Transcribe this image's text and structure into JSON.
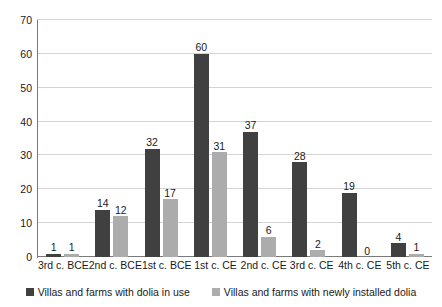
{
  "chart_data": {
    "type": "bar",
    "title": "",
    "subtitle": "",
    "xlabel": "",
    "ylabel": "",
    "ylim": [
      0,
      70
    ],
    "ytick_step": 10,
    "yticks": [
      0,
      10,
      20,
      30,
      40,
      50,
      60,
      70
    ],
    "grid": "horizontal",
    "legend_position": "bottom",
    "categories": [
      "3rd c. BCE",
      "2nd c. BCE",
      "1st c. BCE",
      "1st c. CE",
      "2nd c. CE",
      "3rd c. CE",
      "4th c. CE",
      "5th c. CE"
    ],
    "series": [
      {
        "name": "Villas and farms with dolia in use",
        "color": "#404040",
        "values": [
          1,
          14,
          32,
          60,
          37,
          28,
          19,
          4
        ]
      },
      {
        "name": "Villas and farms with newly installed dolia",
        "color": "#acacac",
        "values": [
          1,
          12,
          17,
          31,
          6,
          2,
          0,
          1
        ]
      }
    ],
    "data_labels": true,
    "annotations": []
  },
  "colors": {
    "series_a": "#404040",
    "series_b": "#acacac",
    "gridline": "#d4d4d4",
    "axis": "#7a7a7a",
    "text": "#1a1a1a",
    "background": "#ffffff"
  }
}
